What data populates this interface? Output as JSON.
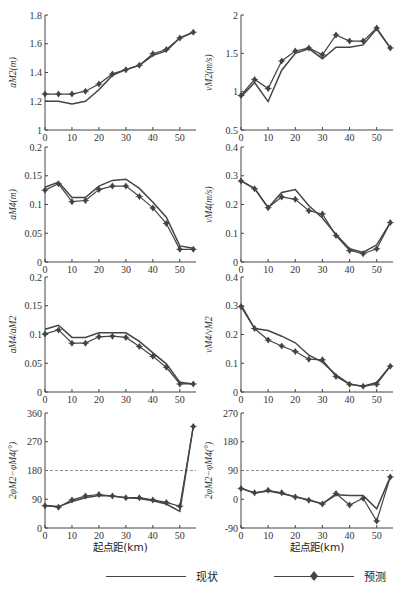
{
  "figure": {
    "xlabel": "起点距(km)",
    "x_ticks": [
      0,
      10,
      20,
      30,
      40,
      50
    ],
    "x_range": [
      0,
      56
    ],
    "legend": [
      {
        "label": "现状",
        "marker": "none"
      },
      {
        "label": "预测",
        "marker": "diamond"
      }
    ]
  },
  "chart_data": [
    {
      "id": "aM2",
      "type": "line",
      "ylabel": "aM2(m)",
      "ylim": [
        1,
        1.8
      ],
      "y_ticks": [
        1,
        1.2,
        1.4,
        1.6,
        1.8
      ],
      "y_tick_labels": [
        "1",
        "1.2",
        "1.4",
        "1.6",
        "1.8"
      ],
      "x": [
        0,
        5,
        10,
        15,
        20,
        25,
        30,
        35,
        40,
        45,
        50,
        55
      ],
      "series": [
        {
          "name": "现状",
          "values": [
            1.2,
            1.2,
            1.18,
            1.2,
            1.28,
            1.38,
            1.42,
            1.45,
            1.52,
            1.55,
            1.64,
            1.68
          ]
        },
        {
          "name": "预测",
          "values": [
            1.25,
            1.25,
            1.25,
            1.27,
            1.32,
            1.39,
            1.42,
            1.45,
            1.53,
            1.56,
            1.64,
            1.68
          ]
        }
      ]
    },
    {
      "id": "vM2",
      "type": "line",
      "ylabel": "vM2(m/s)",
      "ylim": [
        0.5,
        2
      ],
      "y_ticks": [
        0.5,
        1,
        1.5,
        2
      ],
      "y_tick_labels": [
        "0.5",
        "1",
        "1.5",
        "2"
      ],
      "x": [
        0,
        5,
        10,
        15,
        20,
        25,
        30,
        35,
        40,
        45,
        50,
        55
      ],
      "series": [
        {
          "name": "现状",
          "values": [
            0.93,
            1.12,
            0.87,
            1.28,
            1.5,
            1.56,
            1.43,
            1.58,
            1.58,
            1.61,
            1.82,
            1.57
          ]
        },
        {
          "name": "预测",
          "values": [
            0.95,
            1.16,
            1.04,
            1.4,
            1.53,
            1.57,
            1.48,
            1.74,
            1.66,
            1.66,
            1.83,
            1.57
          ]
        }
      ]
    },
    {
      "id": "aM4",
      "type": "line",
      "ylabel": "aM4(m)",
      "ylim": [
        0,
        0.2
      ],
      "y_ticks": [
        0,
        0.05,
        0.1,
        0.15,
        0.2
      ],
      "y_tick_labels": [
        "0",
        "0.05",
        "0.1",
        "0.15",
        "0.2"
      ],
      "x": [
        0,
        5,
        10,
        15,
        20,
        25,
        30,
        35,
        40,
        45,
        50,
        55
      ],
      "series": [
        {
          "name": "现状",
          "values": [
            0.13,
            0.139,
            0.112,
            0.112,
            0.132,
            0.142,
            0.144,
            0.128,
            0.104,
            0.078,
            0.028,
            0.024
          ]
        },
        {
          "name": "预测",
          "values": [
            0.125,
            0.136,
            0.105,
            0.107,
            0.126,
            0.132,
            0.132,
            0.114,
            0.094,
            0.067,
            0.022,
            0.022
          ]
        }
      ]
    },
    {
      "id": "vM4",
      "type": "line",
      "ylabel": "vM4(m/s)",
      "ylim": [
        0,
        0.4
      ],
      "y_ticks": [
        0,
        0.1,
        0.2,
        0.3,
        0.4
      ],
      "y_tick_labels": [
        "0",
        "0.1",
        "0.2",
        "0.3",
        "0.4"
      ],
      "x": [
        0,
        5,
        10,
        15,
        20,
        25,
        30,
        35,
        40,
        45,
        50,
        55
      ],
      "series": [
        {
          "name": "现状",
          "values": [
            0.282,
            0.256,
            0.189,
            0.242,
            0.252,
            0.196,
            0.153,
            0.096,
            0.046,
            0.033,
            0.06,
            0.137
          ]
        },
        {
          "name": "预测",
          "values": [
            0.282,
            0.255,
            0.189,
            0.226,
            0.218,
            0.178,
            0.167,
            0.092,
            0.04,
            0.029,
            0.046,
            0.137
          ]
        }
      ]
    },
    {
      "id": "aM4_aM2",
      "type": "line",
      "ylabel": "aM4/aM2",
      "ylim": [
        0,
        0.2
      ],
      "y_ticks": [
        0,
        0.05,
        0.1,
        0.15,
        0.2
      ],
      "y_tick_labels": [
        "0",
        "0.05",
        "0.1",
        "0.15",
        "0.2"
      ],
      "x": [
        0,
        5,
        10,
        15,
        20,
        25,
        30,
        35,
        40,
        45,
        50,
        55
      ],
      "series": [
        {
          "name": "现状",
          "values": [
            0.109,
            0.116,
            0.095,
            0.095,
            0.103,
            0.103,
            0.103,
            0.088,
            0.068,
            0.049,
            0.017,
            0.014
          ]
        },
        {
          "name": "预测",
          "values": [
            0.101,
            0.108,
            0.085,
            0.085,
            0.096,
            0.097,
            0.095,
            0.079,
            0.062,
            0.043,
            0.014,
            0.014
          ]
        }
      ]
    },
    {
      "id": "vM4_vM2",
      "type": "line",
      "ylabel": "vM4/vM2",
      "ylim": [
        0,
        0.4
      ],
      "y_ticks": [
        0,
        0.1,
        0.2,
        0.3,
        0.4
      ],
      "y_tick_labels": [
        "0",
        "0.1",
        "0.2",
        "0.3",
        "0.4"
      ],
      "x": [
        0,
        5,
        10,
        15,
        20,
        25,
        30,
        35,
        40,
        45,
        50,
        55
      ],
      "series": [
        {
          "name": "现状",
          "values": [
            0.303,
            0.221,
            0.214,
            0.194,
            0.171,
            0.128,
            0.104,
            0.06,
            0.027,
            0.02,
            0.033,
            0.09
          ]
        },
        {
          "name": "预测",
          "values": [
            0.297,
            0.221,
            0.181,
            0.16,
            0.141,
            0.114,
            0.112,
            0.054,
            0.027,
            0.02,
            0.027,
            0.09
          ]
        }
      ]
    },
    {
      "id": "phase_surface",
      "type": "line",
      "ylabel": "2φM2−φM4(°)",
      "xlabel": "起点距(km)",
      "ylim": [
        0,
        360
      ],
      "y_ticks": [
        0,
        90,
        180,
        270,
        360
      ],
      "y_tick_labels": [
        "0",
        "90",
        "180",
        "270",
        "360"
      ],
      "reference_line": {
        "y": 180,
        "style": "dashed"
      },
      "x": [
        0,
        5,
        10,
        15,
        20,
        25,
        30,
        35,
        40,
        45,
        50,
        55
      ],
      "series": [
        {
          "name": "现状",
          "values": [
            70,
            67,
            83,
            95,
            102,
            100,
            95,
            92,
            85,
            75,
            52,
            318
          ]
        },
        {
          "name": "预测",
          "values": [
            70,
            65,
            88,
            100,
            105,
            100,
            95,
            95,
            88,
            80,
            68,
            318
          ]
        }
      ]
    },
    {
      "id": "phase_velocity",
      "type": "line",
      "ylabel": "2φM2−φM4(°)",
      "xlabel": "起点距(km)",
      "ylim": [
        -90,
        270
      ],
      "y_ticks": [
        -90,
        0,
        90,
        180,
        270
      ],
      "y_tick_labels": [
        "-90",
        "0",
        "90",
        "180",
        "270"
      ],
      "reference_line": {
        "y": 90,
        "style": "dashed"
      },
      "x": [
        0,
        5,
        10,
        15,
        20,
        25,
        30,
        35,
        40,
        45,
        50,
        55
      ],
      "series": [
        {
          "name": "现状",
          "values": [
            34,
            20,
            26,
            18,
            8,
            -2,
            -14,
            14,
            12,
            12,
            -30,
            70
          ]
        },
        {
          "name": "预测",
          "values": [
            34,
            20,
            28,
            20,
            7,
            -3,
            -15,
            18,
            -18,
            3,
            -68,
            70
          ]
        }
      ]
    }
  ]
}
